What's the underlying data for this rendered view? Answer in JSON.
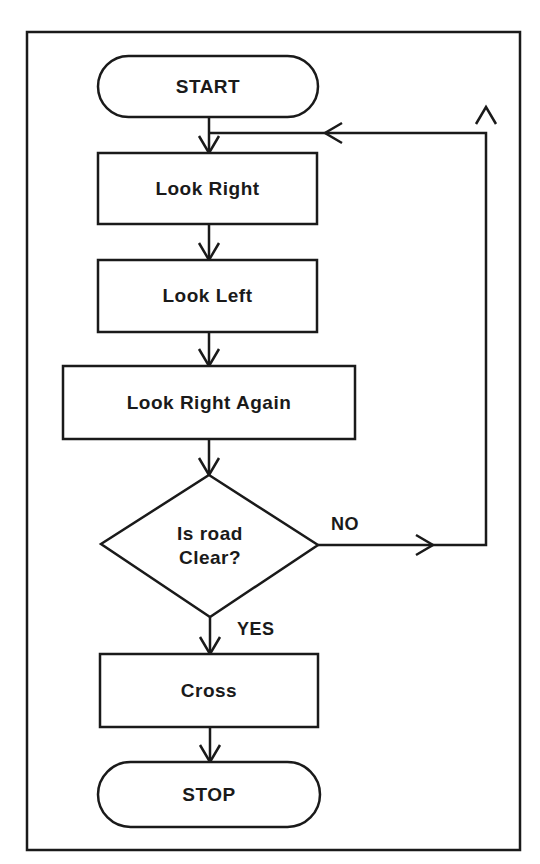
{
  "diagram": {
    "type": "flowchart",
    "colors": {
      "stroke": "#1a1a1a",
      "background": "#ffffff",
      "text": "#1a1a1a"
    },
    "nodes": [
      {
        "id": "start",
        "shape": "terminator",
        "label": "START"
      },
      {
        "id": "look_right",
        "shape": "process",
        "label": "Look Right"
      },
      {
        "id": "look_left",
        "shape": "process",
        "label": "Look Left"
      },
      {
        "id": "look_right_again",
        "shape": "process",
        "label": "Look Right Again"
      },
      {
        "id": "decision",
        "shape": "decision",
        "label_line1": "Is road",
        "label_line2": "Clear?"
      },
      {
        "id": "cross",
        "shape": "process",
        "label": "Cross"
      },
      {
        "id": "stop",
        "shape": "terminator",
        "label": "STOP"
      }
    ],
    "edges": [
      {
        "from": "start",
        "to": "look_right",
        "label": ""
      },
      {
        "from": "look_right",
        "to": "look_left",
        "label": ""
      },
      {
        "from": "look_left",
        "to": "look_right_again",
        "label": ""
      },
      {
        "from": "look_right_again",
        "to": "decision",
        "label": ""
      },
      {
        "from": "decision",
        "to": "look_right",
        "label": "NO"
      },
      {
        "from": "decision",
        "to": "cross",
        "label": "YES"
      },
      {
        "from": "cross",
        "to": "stop",
        "label": ""
      }
    ],
    "branch_labels": {
      "no": "NO",
      "yes": "YES"
    }
  }
}
